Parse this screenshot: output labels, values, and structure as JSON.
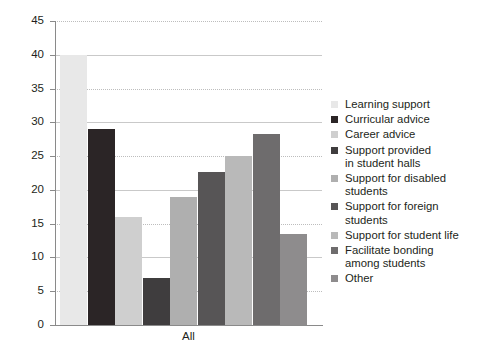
{
  "chart_data": {
    "type": "bar",
    "title": "",
    "subtitle": "",
    "xlabel": "All",
    "ylabel": "",
    "categories": [
      "All"
    ],
    "ylim": [
      0,
      45
    ],
    "ytick_labels": [
      "0",
      "5",
      "10",
      "15",
      "20",
      "25",
      "30",
      "35",
      "40",
      "45"
    ],
    "ytick_values": [
      0,
      5,
      10,
      15,
      20,
      25,
      30,
      35,
      40,
      45
    ],
    "grid": true,
    "legend_position": "right",
    "series": [
      {
        "name": "Learning support",
        "values": [
          40.0
        ],
        "color": "#e8e8e8"
      },
      {
        "name": "Curricular advice",
        "values": [
          29.0
        ],
        "color": "#2b2526"
      },
      {
        "name": "Career advice",
        "values": [
          16.0
        ],
        "color": "#cfcfcf"
      },
      {
        "name": "Support provided\nin student halls",
        "values": [
          7.0
        ],
        "color": "#3f3d3e"
      },
      {
        "name": "Support for disabled\nstudents",
        "values": [
          19.0
        ],
        "color": "#afafaf"
      },
      {
        "name": "Support for foreign\nstudents",
        "values": [
          22.7
        ],
        "color": "#575556"
      },
      {
        "name": "Support for student life",
        "values": [
          25.0
        ],
        "color": "#b9b9b9"
      },
      {
        "name": "Facilitate bonding\namong students",
        "values": [
          28.3
        ],
        "color": "#6e6c6d"
      },
      {
        "name": "Other",
        "values": [
          13.4
        ],
        "color": "#8e8c8d"
      }
    ]
  },
  "legend": {
    "items": [
      {
        "label": "Learning support"
      },
      {
        "label": "Curricular advice"
      },
      {
        "label": "Career advice"
      },
      {
        "label": "Support provided\nin student halls"
      },
      {
        "label": "Support for disabled\nstudents"
      },
      {
        "label": "Support for foreign\nstudents"
      },
      {
        "label": "Support for student life"
      },
      {
        "label": "Facilitate bonding\namong students"
      },
      {
        "label": "Other"
      }
    ]
  },
  "axes": {
    "x_category_label": "All"
  }
}
